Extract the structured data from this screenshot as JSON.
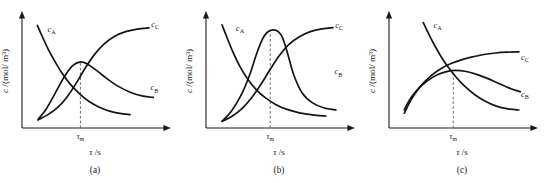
{
  "figure": {
    "background_color": "#ffffff",
    "ink_color": "#1a1a1a",
    "axis_labels": {
      "x": "τ /s",
      "x_symbol": "τ",
      "x_unit": "/s",
      "y": "c /(mol/ m³)",
      "y_symbol": "c",
      "y_unit": "/(mol/ m³)"
    },
    "tick_label": "τ",
    "tick_subscript": "m"
  },
  "chart_data": [
    {
      "type": "line",
      "title": "",
      "panel_caption": "(a)",
      "xlabel": "τ /s",
      "ylabel": "c /(mol/ m³)",
      "xlim": [
        0,
        1
      ],
      "ylim": [
        0,
        1
      ],
      "grid": false,
      "legend": "inline-curve-labels",
      "annotations": [
        {
          "text": "τm",
          "axis": "x",
          "value": 0.4,
          "style": "dashed-vertical-to-peak"
        }
      ],
      "series": [
        {
          "name": "c_A",
          "label": "c",
          "label_sub": "A",
          "label_x": 0.175,
          "label_y": 0.845,
          "description": "reactant A, monotonic exponential decay from high start to near zero",
          "x": [
            0.105,
            0.14,
            0.18,
            0.225,
            0.275,
            0.33,
            0.395,
            0.46,
            0.53,
            0.6,
            0.67,
            0.74
          ],
          "y": [
            0.9,
            0.8,
            0.69,
            0.585,
            0.48,
            0.385,
            0.3,
            0.232,
            0.182,
            0.148,
            0.128,
            0.118
          ]
        },
        {
          "name": "c_B",
          "label": "c",
          "label_sub": "B",
          "label_x": 0.88,
          "label_y": 0.33,
          "description": "intermediate B, moderate rounded maximum at tau_m then slow decay",
          "x": [
            0.11,
            0.165,
            0.225,
            0.29,
            0.345,
            0.4,
            0.45,
            0.51,
            0.58,
            0.66,
            0.745,
            0.83,
            0.9
          ],
          "y": [
            0.075,
            0.165,
            0.3,
            0.45,
            0.545,
            0.58,
            0.56,
            0.505,
            0.435,
            0.365,
            0.312,
            0.28,
            0.268
          ]
        },
        {
          "name": "c_C",
          "label": "c",
          "label_sub": "C",
          "label_x": 0.885,
          "label_y": 0.885,
          "description": "product C, sigmoidal rise saturating at high plateau",
          "x": [
            0.11,
            0.175,
            0.245,
            0.31,
            0.375,
            0.435,
            0.5,
            0.565,
            0.635,
            0.71,
            0.79,
            0.87
          ],
          "y": [
            0.07,
            0.115,
            0.18,
            0.275,
            0.4,
            0.53,
            0.65,
            0.74,
            0.805,
            0.845,
            0.868,
            0.878
          ]
        }
      ]
    },
    {
      "type": "line",
      "title": "",
      "panel_caption": "(b)",
      "xlabel": "τ /s",
      "ylabel": "c /(mol/ m³)",
      "xlim": [
        0,
        1
      ],
      "ylim": [
        0,
        1
      ],
      "grid": false,
      "legend": "inline-curve-labels",
      "annotations": [
        {
          "text": "τm",
          "axis": "x",
          "value": 0.44,
          "style": "dashed-vertical-to-peak"
        }
      ],
      "series": [
        {
          "name": "c_A",
          "label": "c",
          "label_sub": "A",
          "label_x": 0.205,
          "label_y": 0.855,
          "description": "reactant A, steep exponential decay",
          "x": [
            0.11,
            0.145,
            0.185,
            0.23,
            0.285,
            0.345,
            0.41,
            0.48,
            0.555,
            0.64,
            0.73,
            0.82
          ],
          "y": [
            0.905,
            0.79,
            0.665,
            0.545,
            0.43,
            0.335,
            0.262,
            0.205,
            0.163,
            0.133,
            0.115,
            0.105
          ]
        },
        {
          "name": "c_B",
          "label": "c",
          "label_sub": "B",
          "label_x": 0.88,
          "label_y": 0.47,
          "description": "intermediate B, tall sharp peak with steep rise and steep fall",
          "x": [
            0.11,
            0.175,
            0.245,
            0.3,
            0.345,
            0.385,
            0.42,
            0.46,
            0.495,
            0.525,
            0.56,
            0.6,
            0.66,
            0.73,
            0.81,
            0.89
          ],
          "y": [
            0.06,
            0.15,
            0.3,
            0.47,
            0.645,
            0.775,
            0.84,
            0.86,
            0.845,
            0.79,
            0.65,
            0.47,
            0.305,
            0.22,
            0.175,
            0.158
          ]
        },
        {
          "name": "c_C",
          "label": "c",
          "label_sub": "C",
          "label_x": 0.885,
          "label_y": 0.88,
          "description": "product C, sigmoidal rise to plateau",
          "x": [
            0.11,
            0.18,
            0.25,
            0.315,
            0.38,
            0.44,
            0.505,
            0.57,
            0.64,
            0.715,
            0.795,
            0.87
          ],
          "y": [
            0.058,
            0.105,
            0.175,
            0.27,
            0.39,
            0.515,
            0.64,
            0.735,
            0.8,
            0.845,
            0.87,
            0.88
          ]
        }
      ]
    },
    {
      "type": "line",
      "title": "",
      "panel_caption": "(c)",
      "xlabel": "τ /s",
      "ylabel": "c /(mol/ m³)",
      "xlim": [
        0,
        1
      ],
      "ylim": [
        0,
        1
      ],
      "grid": false,
      "legend": "inline-curve-labels",
      "annotations": [
        {
          "text": "τm",
          "axis": "x",
          "value": 0.44,
          "style": "dashed-vertical-to-peak"
        }
      ],
      "series": [
        {
          "name": "c_A",
          "label": "c",
          "label_sub": "A",
          "label_x": 0.305,
          "label_y": 0.875,
          "description": "reactant A, exponential decay starting high",
          "x": [
            0.235,
            0.27,
            0.31,
            0.355,
            0.405,
            0.46,
            0.52,
            0.59,
            0.66,
            0.735,
            0.815,
            0.89
          ],
          "y": [
            0.925,
            0.83,
            0.73,
            0.63,
            0.535,
            0.445,
            0.365,
            0.29,
            0.235,
            0.192,
            0.168,
            0.158
          ]
        },
        {
          "name": "c_B",
          "label": "c",
          "label_sub": "B",
          "label_x": 0.905,
          "label_y": 0.275,
          "description": "intermediate B, broad flat shallow maximum then gentle decline",
          "x": [
            0.105,
            0.15,
            0.205,
            0.27,
            0.335,
            0.4,
            0.455,
            0.52,
            0.59,
            0.665,
            0.745,
            0.825,
            0.9
          ],
          "y": [
            0.16,
            0.265,
            0.35,
            0.42,
            0.47,
            0.497,
            0.505,
            0.498,
            0.475,
            0.44,
            0.395,
            0.35,
            0.318
          ]
        },
        {
          "name": "c_C",
          "label": "c",
          "label_sub": "C",
          "label_x": 0.905,
          "label_y": 0.6,
          "description": "product C, concave rise to moderate plateau",
          "x": [
            0.105,
            0.155,
            0.215,
            0.285,
            0.355,
            0.425,
            0.5,
            0.575,
            0.65,
            0.73,
            0.81,
            0.89
          ],
          "y": [
            0.13,
            0.255,
            0.365,
            0.455,
            0.52,
            0.565,
            0.6,
            0.625,
            0.645,
            0.658,
            0.665,
            0.668
          ]
        }
      ]
    }
  ]
}
